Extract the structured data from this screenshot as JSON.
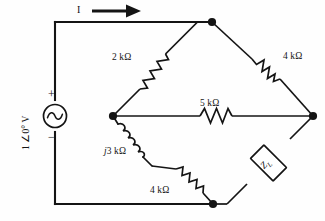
{
  "figure": {
    "type": "circuit-schematic",
    "stroke_color": "#141414",
    "background_color": "#fefefe"
  },
  "source": {
    "kind": "ac-voltage-source",
    "label": "1 ∠0° V",
    "plus_sign": "+",
    "minus_sign": "−",
    "orientation": "vertical-left-branch",
    "label_rotation_deg": -90
  },
  "current": {
    "label": "I",
    "direction": "right",
    "arrow_glyph": "→"
  },
  "components": [
    {
      "id": "r-top-left",
      "name": "resistor-2k",
      "label": "2 kΩ",
      "kind": "resistor",
      "from_node": "left-middle",
      "to_node": "top"
    },
    {
      "id": "r-top-right",
      "name": "resistor-4k-top",
      "label": "4 kΩ",
      "kind": "resistor",
      "from_node": "top",
      "to_node": "right"
    },
    {
      "id": "r-middle",
      "name": "resistor-5k",
      "label": "5 kΩ",
      "kind": "resistor",
      "from_node": "left-middle",
      "to_node": "right"
    },
    {
      "id": "l-bottom-left",
      "name": "inductor-j3k",
      "label": "j3 kΩ",
      "label_italic_prefix": "j",
      "label_rest": "3 kΩ",
      "kind": "inductor",
      "from_node": "left-middle",
      "to_node": "mid-lower"
    },
    {
      "id": "r-bottom-left",
      "name": "resistor-4k-bottom",
      "label": "4 kΩ",
      "kind": "resistor",
      "from_node": "mid-lower",
      "to_node": "bottom"
    },
    {
      "id": "z-load",
      "name": "load-impedance",
      "label": "Z",
      "label_subscript": "L",
      "kind": "impedance-box",
      "from_node": "right",
      "to_node": "bottom"
    }
  ],
  "nodes": [
    {
      "id": "top",
      "name": "node-top",
      "x": 212,
      "y": 22
    },
    {
      "id": "right",
      "name": "node-right",
      "x": 313,
      "y": 116
    },
    {
      "id": "left-middle",
      "name": "node-left-middle",
      "x": 113,
      "y": 116
    },
    {
      "id": "bottom",
      "name": "node-bottom",
      "x": 213,
      "y": 204
    }
  ]
}
